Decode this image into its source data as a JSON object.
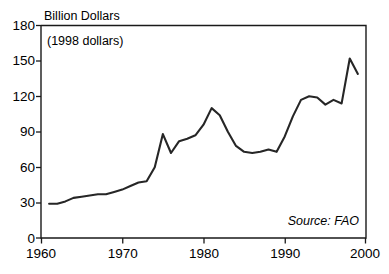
{
  "chart_data": {
    "type": "line",
    "title": "Billion Dollars",
    "subtitle": "(1998 dollars)",
    "xlabel": "",
    "ylabel": "Billion Dollars",
    "xlim": [
      1960,
      2000
    ],
    "ylim": [
      0,
      180
    ],
    "grid": false,
    "legend": null,
    "source_note": "Source: FAO",
    "x_ticks": [
      "1960",
      "1970",
      "1980",
      "1990",
      "2000"
    ],
    "y_ticks": [
      "0",
      "30",
      "60",
      "90",
      "120",
      "150",
      "180"
    ],
    "x": [
      1961,
      1962,
      1963,
      1964,
      1965,
      1966,
      1967,
      1968,
      1969,
      1970,
      1971,
      1972,
      1973,
      1974,
      1975,
      1976,
      1977,
      1978,
      1979,
      1980,
      1981,
      1982,
      1983,
      1984,
      1985,
      1986,
      1987,
      1988,
      1989,
      1990,
      1991,
      1992,
      1993,
      1994,
      1995,
      1996,
      1997,
      1998,
      1999
    ],
    "values": [
      29,
      29,
      31,
      34,
      35,
      36,
      37,
      37,
      39,
      41,
      44,
      47,
      48,
      60,
      88,
      72,
      82,
      84,
      87,
      96,
      110,
      104,
      90,
      78,
      73,
      72,
      73,
      75,
      73,
      86,
      103,
      117,
      120,
      119,
      113,
      117,
      114,
      152,
      139
    ],
    "series": [
      {
        "name": "Agricultural trade value",
        "values": [
          29,
          29,
          31,
          34,
          35,
          36,
          37,
          37,
          39,
          41,
          44,
          47,
          48,
          60,
          88,
          72,
          82,
          84,
          87,
          96,
          110,
          104,
          90,
          78,
          73,
          72,
          73,
          75,
          73,
          86,
          103,
          117,
          120,
          119,
          113,
          117,
          114,
          152,
          139
        ]
      }
    ],
    "units": "Billion Dollars (1998 dollars)"
  }
}
